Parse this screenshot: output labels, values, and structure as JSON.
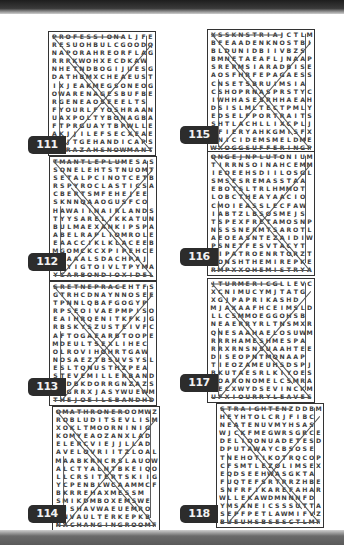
{
  "page": {
    "puzzles": [
      {
        "number": "111",
        "rows": [
          "PROFESSIONALJFE",
          "RESUOHBULCGOODQ",
          "NAPORAHREORFLAG",
          "RRRKWOHXECDKAW",
          "NHETNDBOGIJUESG",
          "DATHBMXCHEAEUST",
          "IXJEAKMEGSONEOG",
          "OWARENAGESBUFBE",
          "RGENEAOSEEELTS",
          "FYOURLFYOSHRAAN",
          "UAXPOLTYBONAGBA",
          "FTPRGUAYTBPWLLE",
          "AKJJILEFSECXEAE",
          "CMJTGEHANDICAPS",
          "SDRAZAHSNOWMANT"
        ]
      },
      {
        "number": "115",
        "rows": [
          "XSSKNSTRIAJCTLM",
          "BFEAADENKNOSTBI",
          "BLDUNIDBIIVBZS",
          "BMNETAEAFLJNAAP",
          "SRERMSIARADBISE",
          "AOSFHRFEPAGAESSR",
          "CNSETSBRUIMSIA",
          "CSHOPRNASPRSTYC",
          "IWHHASESRHHAEAH",
          "DSISLMLTECTPMLY",
          "EDSELFPORTRAITS",
          "SHTLACHLLIXCPLJ",
          "TFIERYAHKGMISFX",
          "ENICIDEMSMELDME",
          "WXOGGSUFFERINGP"
        ]
      },
      {
        "number": "112",
        "rows": [
          "TMANTLEPLUMESAS",
          "SONELEHTSTNUOMT",
          "SETALPCINOTCETB",
          "RSPYROCLASTICSA",
          "CBERTSMFEHEJEE",
          "SKNNQAAOGUSFCO",
          "HAWAIINAIRLANDS",
          "TYYSARELIKKATUNP",
          "BULMAEXANKIPSPA",
          "ABELRAPLIOMROLE",
          "EAACCIKLKLACEEB",
          "MGOMCKCXPIPEHCE",
          "KNAAALSDACHPAJ",
          "EIYIGTOIVLTPYMA",
          "YCARBONDIOXIDEL"
        ]
      },
      {
        "number": "116",
        "rows": [
          "ONGEJNPLUTONIUM",
          "TIRRNSOINAHCEMM",
          "IEOEEHSDIILOSGLA",
          "SMSFSREMASSTAA",
          "EBOTSLTRLHMMOT",
          "LOBCTHEAYAACIO",
          "CMOIEASSLECFAW",
          "IABTZLBSOSMEJS",
          "TSPEXFRETAMOSNP",
          "NSSSNERMTSAROTL",
          "AEOEASNTEZAIDIW",
          "PSNETFESVTACYT",
          "CIPATROENRTORZT",
          "KONSHTHEMIREPKE",
          "RMPXXOHEMISTRYA"
        ]
      },
      {
        "number": "113",
        "rows": [
          "SRETNEPRACEHTFS",
          "GTRHCDNAYNNOSEE",
          "TPNNLQBAFGOGYP",
          "RPSEOIVAEPMPISO",
          "EAIHRQENITKFKJG",
          "RBSKYSZUSTEIVFC",
          "AFTOGAEARBTOOPE",
          "MDEULTSEXLIHEC",
          "OLROVIHOHRTGAW",
          "NOSAEZTBSUVSYSL",
          "ESLTQNUSTHZPEA",
          "STEVEMILLERBANDS",
          "QRDBKDORRGNZAZS",
          "SNGRRXJASYWUEWM",
          "THEJOEILSBANDHD"
        ]
      },
      {
        "number": "117",
        "rows": [
          "JTURMERICGLLEVC",
          "XCNIMUCYMJTATG",
          "XGJPAPRIKASHD",
          "MJAXAAFHCEIMSLD",
          "LLCSMMOEGGOHSB",
          "NEAERRYRLTNSMXR",
          "QNESAAHAELOSUWM",
          "RRRHAMESHMESPA",
          "RRXRNSNSUAAHTEE",
          "DISEOPNTMQNAAP",
          "TIEOZAMEUHSDSPJ",
          "BKUTAESRLKIYOES",
          "SOARONOMELCSMRA",
          "TECXWYDSEVINCKM",
          "UFXIOURRYLEAVES"
        ]
      },
      {
        "number": "114",
        "rows": [
          "OMATHRONEROOMWZ",
          "ROBLUDITSEVLISM",
          "XOKLTMOORNINIG",
          "KOMYEAOZANXLAD",
          "ELERCVIEJJLLAD",
          "AVELOVRIITZLOAL",
          "MAABKRNCRSLAUOW",
          "ALCTYALNTBKEIQO",
          "LLCRSITERTSKIIG",
          "YCPENBLWCAAMMCF",
          "BKRREHAXMESSM",
          "SMIKDMBOXEMSWE",
          "OJSHAVWAEUEMRO",
          "SNVAULTERKEPKB",
          "NACHANGINGROOMF"
        ]
      },
      {
        "number": "118",
        "rows": [
          "STRAIGHTENZDDBM",
          "HEYHTOLCRJFIBC",
          "NEATENUVMYHSAS",
          "WJCKFMEGWRSGRCE",
          "DELIOONUADETESD",
          "DPUTAWAYCBSOSE",
          "TNEHOTIKOTRQCOP",
          "CFSMTLEZOLIMSEXC",
          "EQDSEEHWASGKTA",
          "FUQTEFSRTRRZHBEK",
          "SNFRFIKAREFAHARYE",
          "WLLEKAWDMNNNFD",
          "YMSANEICSSSUTTAY",
          "SEPFPETLAWMIFVZA",
          "BUEUHSBSESCTLMF"
        ]
      }
    ]
  }
}
